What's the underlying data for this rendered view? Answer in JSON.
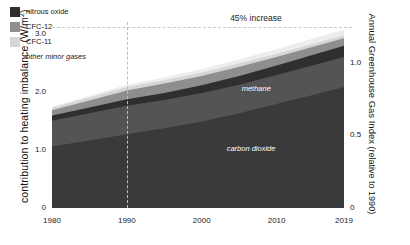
{
  "chart_data": {
    "type": "area",
    "title": "",
    "xlabel": "",
    "ylabel": "contribution to heating imbalance (W/m²)",
    "y2label": "Annual Greenhouse Gas Index (relative to 1990)",
    "xlim": [
      1980,
      2019
    ],
    "ylim": [
      0,
      3.2
    ],
    "y2lim": [
      0,
      1.28
    ],
    "grid": false,
    "legend_position": "top-left",
    "stacked": true,
    "xticks": [
      "1980",
      "1990",
      "2000",
      "2010",
      "2019"
    ],
    "xtick_values": [
      1980,
      1990,
      2000,
      2010,
      2019
    ],
    "yticks": [
      "0",
      "1.0",
      "2.0",
      "3.0"
    ],
    "ytick_values": [
      0,
      1.0,
      2.0,
      3.0
    ],
    "y2ticks": [
      "0",
      "0.5",
      "1.0"
    ],
    "y2tick_values": [
      0,
      0.5,
      1.0
    ],
    "x": [
      1980,
      1985,
      1990,
      1995,
      2000,
      2005,
      2010,
      2015,
      2019
    ],
    "series": [
      {
        "name": "carbon dioxide",
        "color": "#3a3a3a",
        "values": [
          1.06,
          1.16,
          1.27,
          1.37,
          1.49,
          1.63,
          1.79,
          1.95,
          2.08
        ]
      },
      {
        "name": "methane",
        "color": "#545454",
        "values": [
          0.44,
          0.47,
          0.49,
          0.49,
          0.49,
          0.49,
          0.5,
          0.51,
          0.52
        ]
      },
      {
        "name": "nitrous oxide",
        "color": "#2f2f2f",
        "values": [
          0.09,
          0.1,
          0.11,
          0.12,
          0.13,
          0.15,
          0.16,
          0.18,
          0.19
        ]
      },
      {
        "name": "CFC-12",
        "color": "#8e8e8e",
        "values": [
          0.09,
          0.12,
          0.15,
          0.16,
          0.16,
          0.16,
          0.15,
          0.14,
          0.13
        ]
      },
      {
        "name": "CFC-11",
        "color": "#d6d6d6",
        "values": [
          0.04,
          0.05,
          0.06,
          0.06,
          0.06,
          0.06,
          0.05,
          0.05,
          0.05
        ]
      },
      {
        "name": "other minor gases",
        "color": "#ededed",
        "values": [
          0.02,
          0.03,
          0.04,
          0.05,
          0.06,
          0.07,
          0.08,
          0.09,
          0.1
        ]
      }
    ],
    "totals": [
      1.74,
      1.93,
      2.12,
      2.25,
      2.39,
      2.56,
      2.73,
      2.92,
      3.07
    ],
    "annotations": [
      {
        "name": "increase-label",
        "text": "45% increase",
        "x": 2007,
        "y": 3.15
      },
      {
        "name": "methane-label",
        "text": "methane",
        "x": 2008,
        "y": 2.05
      },
      {
        "name": "carbon-dioxide-label",
        "text": "carbon dioxide",
        "x": 2006,
        "y": 1.02
      }
    ],
    "reference_lines": [
      {
        "name": "increase-dashed-horizontal",
        "orientation": "horizontal",
        "y": 3.12
      },
      {
        "name": "year-1990-dashed-vertical",
        "orientation": "vertical",
        "x": 1990
      }
    ]
  },
  "legend": {
    "items": [
      {
        "label": "nitrous oxide",
        "color": "#2f2f2f",
        "swatch": true
      },
      {
        "label": "CFC-12",
        "color": "#8e8e8e",
        "swatch": true
      },
      {
        "label": "CFC-11",
        "color": "#d6d6d6",
        "swatch": true
      },
      {
        "label": "other minor gases",
        "color": "#ededed",
        "swatch": false
      }
    ]
  },
  "axes": {
    "left_title_main": "contribution to heating imbalance (W/m",
    "left_title_sup": "2",
    "left_title_close": ")",
    "right_title_line1": "Annual Greenhouse Gas Index",
    "right_title_line2": "(relative to 1990)"
  }
}
